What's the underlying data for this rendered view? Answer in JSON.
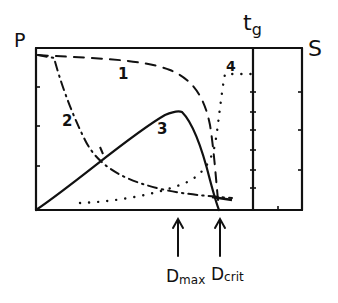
{
  "diagram": {
    "left_axis_label": "P",
    "right_axis_label": "S",
    "divider_label": "t",
    "divider_label_sub": "g",
    "curves": [
      {
        "id": "1",
        "label": "1",
        "style": "dashed",
        "description": "starts high near top-left, stays high, falls steeply toward Dcrit"
      },
      {
        "id": "2",
        "label": "2",
        "style": "dash-dot",
        "description": "starts high, drops quickly, decays to low level near Dcrit"
      },
      {
        "id": "3",
        "label": "3",
        "style": "solid",
        "description": "rises from origin to a maximum at Dmax, then falls to zero at Dcrit"
      },
      {
        "id": "4",
        "label": "4",
        "style": "dotted",
        "description": "low near bottom, rises slowly then sharply after Dcrit, plateaus up to t_g"
      }
    ],
    "markers": [
      {
        "label_main": "D",
        "label_sub": "max",
        "description": "arrow at maximum of curve 3"
      },
      {
        "label_main": "D",
        "label_sub": "crit",
        "description": "arrow at critical point"
      }
    ],
    "colors": {
      "ink": "#111111",
      "background": "#ffffff"
    }
  }
}
